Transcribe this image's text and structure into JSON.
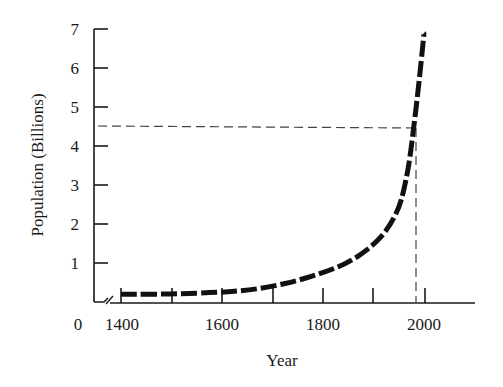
{
  "chart_data": {
    "type": "line",
    "title": "",
    "xlabel": "Year",
    "ylabel": "Population (Billions)",
    "x_ticks": [
      1400,
      1500,
      1600,
      1700,
      1800,
      1900,
      2000
    ],
    "x_tick_labels": [
      "0",
      "1400",
      "1600",
      "1800",
      "2000"
    ],
    "y_ticks": [
      1,
      2,
      3,
      4,
      5,
      6,
      7
    ],
    "y_tick_labels": [
      "1",
      "2",
      "3",
      "4",
      "5",
      "6",
      "7"
    ],
    "xlim": [
      1400,
      2100
    ],
    "ylim": [
      0,
      7
    ],
    "axis_break": true,
    "grid": false,
    "series": [
      {
        "name": "World population",
        "style": "thick dashed",
        "x": [
          1400,
          1500,
          1600,
          1650,
          1700,
          1750,
          1800,
          1850,
          1900,
          1930,
          1950,
          1960,
          1970,
          1980,
          1990,
          2000
        ],
        "values": [
          0.2,
          0.2,
          0.25,
          0.3,
          0.4,
          0.55,
          0.75,
          1.0,
          1.45,
          1.9,
          2.4,
          2.85,
          3.5,
          4.5,
          5.6,
          6.9
        ]
      }
    ],
    "annotations": [
      {
        "type": "horizontal-dashed",
        "y": 4.5,
        "label": ""
      },
      {
        "type": "vertical-dashed",
        "x": 1980,
        "label": ""
      }
    ]
  },
  "labels": {
    "xlabel": "Year",
    "ylabel": "Population (Billions)",
    "x_zero": "0",
    "x_ticks": [
      "1400",
      "1600",
      "1800",
      "2000"
    ],
    "y_ticks": [
      "1",
      "2",
      "3",
      "4",
      "5",
      "6",
      "7"
    ]
  }
}
